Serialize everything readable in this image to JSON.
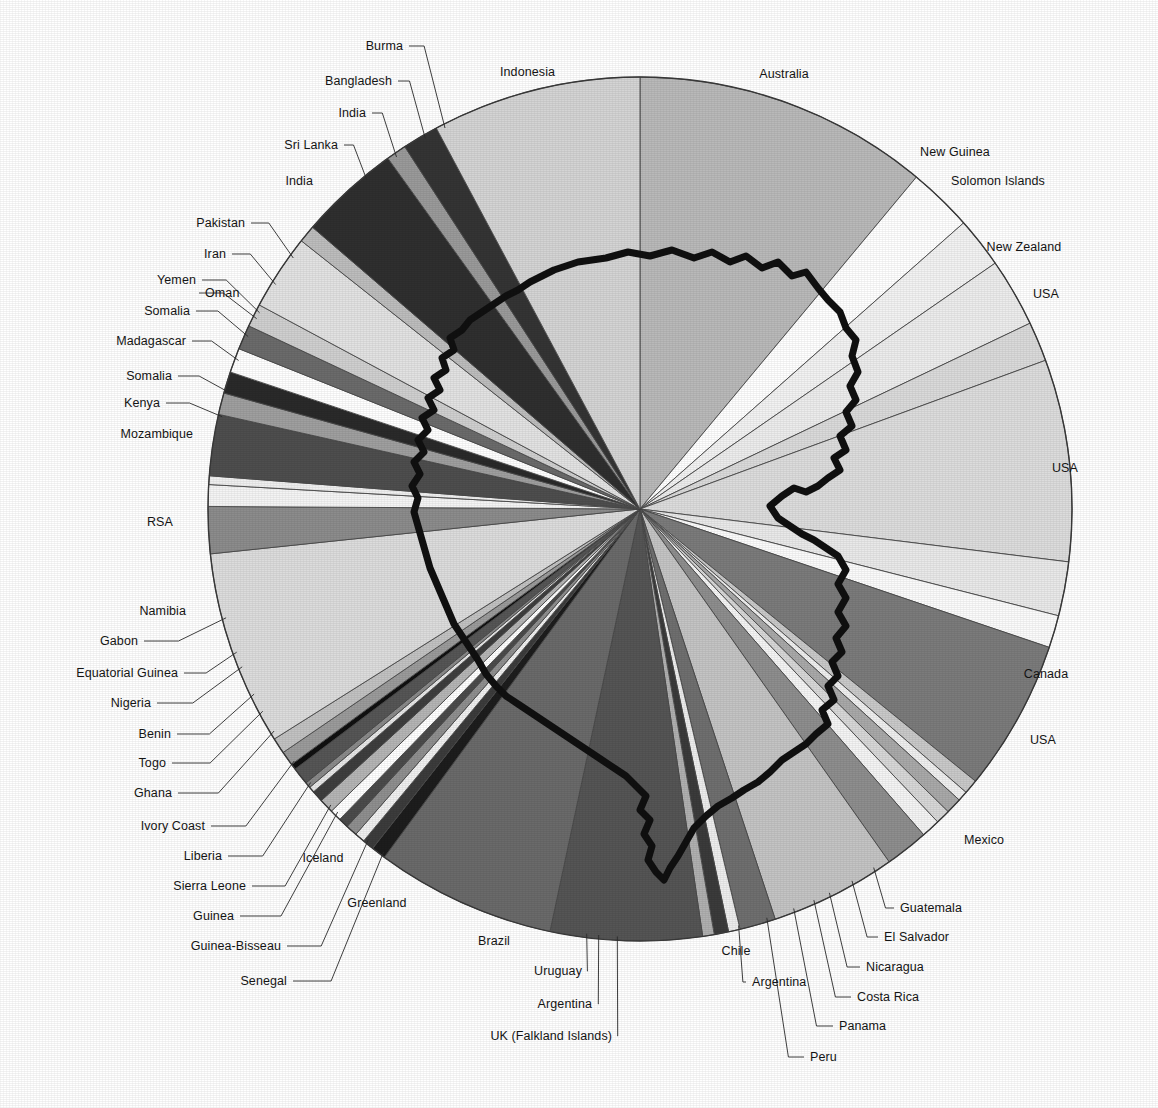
{
  "figure": {
    "type": "pie-wheel-map",
    "center": {
      "x": 640,
      "y": 509
    },
    "radius": 432,
    "background": "#ffffff",
    "outline_color": "#101010",
    "slice_border_color": "#4a4a4a"
  },
  "chart_data": {
    "type": "pie",
    "title": "",
    "subtitle": "",
    "xlabel": "",
    "ylabel": "",
    "legend_position": "leader-lines around perimeter",
    "grid": false,
    "units": "degrees of arc (share of total)",
    "start_angle_deg": -90,
    "direction": "clockwise",
    "categories": [
      "Australia",
      "New Guinea",
      "Solomon Islands",
      "New Zealand",
      "USA",
      "USA",
      "Canada",
      "USA",
      "Mexico",
      "Guatemala",
      "El Salvador",
      "Nicaragua",
      "Costa Rica",
      "Panama",
      "Peru",
      "Chile",
      "Argentina",
      "UK (Falkland Islands)",
      "Argentina",
      "Uruguay",
      "Brazil",
      "Greenland",
      "Iceland",
      "Senegal",
      "Guinea-Bissau",
      "Guinea",
      "Sierra Leone",
      "Liberia",
      "Ivory Coast",
      "Ghana",
      "Togo",
      "Benin",
      "Nigeria",
      "Equatorial Guinea",
      "Gabon",
      "Namibia",
      "RSA",
      "Mozambique",
      "Kenya",
      "Somalia",
      "Madagascar",
      "Somalia",
      "Oman",
      "Yemen",
      "Iran",
      "Pakistan",
      "India",
      "Sri Lanka",
      "India",
      "Bangladesh",
      "Burma",
      "Indonesia"
    ],
    "values": [
      41.0,
      9.0,
      7.0,
      9.5,
      5.5,
      28.0,
      7.5,
      4.5,
      21.0,
      2.0,
      1.4,
      2.2,
      2.0,
      2.6,
      6.0,
      17.5,
      5.0,
      1.6,
      2.0,
      1.6,
      21.0,
      25.0,
      2.0,
      1.6,
      1.4,
      1.6,
      1.4,
      1.6,
      2.0,
      1.6,
      0.8,
      0.8,
      2.4,
      0.8,
      2.0,
      2.2,
      27.0,
      6.5,
      3.0,
      1.2,
      8.5,
      3.0,
      3.0,
      3.4,
      3.4,
      3.2,
      10.5,
      2.4,
      14.0,
      2.8,
      5.0,
      29.0
    ],
    "shades": [
      "#b9b9b9",
      "#ffffff",
      "#f2f2f2",
      "#ececec",
      "#dadada",
      "#dcdcdc",
      "#e9e9e9",
      "#fbfbfb",
      "#7b7b7b",
      "#c9c9c9",
      "#efefef",
      "#a9a9a9",
      "#d7d7d7",
      "#f4f4f4",
      "#8e8e8e",
      "#c4c4c4",
      "#6f6f6f",
      "#ededed",
      "#3b3b3b",
      "#b0b0b0",
      "#555555",
      "#6a6a6a",
      "#1d1d1d",
      "#3c3c3c",
      "#f0f0f0",
      "#8f8f8f",
      "#4b4b4b",
      "#ffffff",
      "#b5b5b5",
      "#3e3e3e",
      "#e7e7e7",
      "#8a8a8a",
      "#565656",
      "#101010",
      "#9b9b9b",
      "#c2c2c2",
      "#dcdcdc",
      "#8c8c8c",
      "#f4f4f4",
      "#efefef",
      "#4e4e4e",
      "#9f9f9f",
      "#2a2a2a",
      "#ffffff",
      "#6b6b6b",
      "#cfcfcf",
      "#e2e2e2",
      "#bdbdbd",
      "#2f2f2f",
      "#9a9a9a",
      "#343434",
      "#d4d4d4"
    ]
  },
  "labels": [
    {
      "id": "burma",
      "text": "Burma",
      "x": 403,
      "y": 46,
      "anchor": "r",
      "leader": true
    },
    {
      "id": "indonesia",
      "text": "Indonesia",
      "x": 500,
      "y": 72,
      "anchor": "l",
      "leader": false
    },
    {
      "id": "australia",
      "text": "Australia",
      "x": 784,
      "y": 74,
      "anchor": "c",
      "leader": false
    },
    {
      "id": "bangladesh",
      "text": "Bangladesh",
      "x": 392,
      "y": 81,
      "anchor": "r",
      "leader": true
    },
    {
      "id": "india-1",
      "text": "India",
      "x": 366,
      "y": 113,
      "anchor": "r",
      "leader": true
    },
    {
      "id": "new-guinea",
      "text": "New Guinea",
      "x": 955,
      "y": 152,
      "anchor": "c",
      "leader": false
    },
    {
      "id": "sri-lanka",
      "text": "Sri Lanka",
      "x": 338,
      "y": 145,
      "anchor": "r",
      "leader": true
    },
    {
      "id": "solomon-islands",
      "text": "Solomon Islands",
      "x": 998,
      "y": 181,
      "anchor": "c",
      "leader": false
    },
    {
      "id": "india-2",
      "text": "India",
      "x": 313,
      "y": 181,
      "anchor": "r",
      "leader": false
    },
    {
      "id": "new-zealand",
      "text": "New Zealand",
      "x": 1024,
      "y": 247,
      "anchor": "c",
      "leader": false
    },
    {
      "id": "pakistan",
      "text": "Pakistan",
      "x": 245,
      "y": 223,
      "anchor": "r",
      "leader": true
    },
    {
      "id": "usa-1",
      "text": "USA",
      "x": 1046,
      "y": 294,
      "anchor": "c",
      "leader": false
    },
    {
      "id": "iran",
      "text": "Iran",
      "x": 226,
      "y": 254,
      "anchor": "r",
      "leader": true
    },
    {
      "id": "yemen",
      "text": "Yemen",
      "x": 196,
      "y": 280,
      "anchor": "r",
      "leader": true
    },
    {
      "id": "oman",
      "text": "Oman",
      "x": 205,
      "y": 293,
      "anchor": "l",
      "leader": true
    },
    {
      "id": "somalia-1",
      "text": "Somalia",
      "x": 190,
      "y": 311,
      "anchor": "r",
      "leader": true
    },
    {
      "id": "madagascar",
      "text": "Madagascar",
      "x": 186,
      "y": 341,
      "anchor": "r",
      "leader": true
    },
    {
      "id": "somalia-2",
      "text": "Somalia",
      "x": 172,
      "y": 376,
      "anchor": "r",
      "leader": true
    },
    {
      "id": "kenya",
      "text": "Kenya",
      "x": 160,
      "y": 403,
      "anchor": "r",
      "leader": true
    },
    {
      "id": "mozambique",
      "text": "Mozambique",
      "x": 193,
      "y": 434,
      "anchor": "r",
      "leader": false
    },
    {
      "id": "usa-2",
      "text": "USA",
      "x": 1065,
      "y": 468,
      "anchor": "c",
      "leader": false
    },
    {
      "id": "rsa",
      "text": "RSA",
      "x": 160,
      "y": 522,
      "anchor": "c",
      "leader": false
    },
    {
      "id": "namibia",
      "text": "Namibia",
      "x": 186,
      "y": 611,
      "anchor": "r",
      "leader": false
    },
    {
      "id": "canada",
      "text": "Canada",
      "x": 1046,
      "y": 674,
      "anchor": "c",
      "leader": false
    },
    {
      "id": "gabon",
      "text": "Gabon",
      "x": 138,
      "y": 641,
      "anchor": "r",
      "leader": true
    },
    {
      "id": "equatorial-guinea",
      "text": "Equatorial Guinea",
      "x": 178,
      "y": 673,
      "anchor": "r",
      "leader": true
    },
    {
      "id": "usa-3",
      "text": "USA",
      "x": 1043,
      "y": 740,
      "anchor": "c",
      "leader": false
    },
    {
      "id": "nigeria",
      "text": "Nigeria",
      "x": 151,
      "y": 703,
      "anchor": "r",
      "leader": true
    },
    {
      "id": "benin",
      "text": "Benin",
      "x": 171,
      "y": 734,
      "anchor": "r",
      "leader": true
    },
    {
      "id": "togo",
      "text": "Togo",
      "x": 166,
      "y": 763,
      "anchor": "r",
      "leader": true
    },
    {
      "id": "ghana",
      "text": "Ghana",
      "x": 172,
      "y": 793,
      "anchor": "r",
      "leader": true
    },
    {
      "id": "ivory-coast",
      "text": "Ivory Coast",
      "x": 205,
      "y": 826,
      "anchor": "r",
      "leader": true
    },
    {
      "id": "mexico",
      "text": "Mexico",
      "x": 984,
      "y": 840,
      "anchor": "c",
      "leader": false
    },
    {
      "id": "liberia",
      "text": "Liberia",
      "x": 222,
      "y": 856,
      "anchor": "r",
      "leader": true
    },
    {
      "id": "iceland",
      "text": "Iceland",
      "x": 323,
      "y": 858,
      "anchor": "c",
      "leader": false
    },
    {
      "id": "sierra-leone",
      "text": "Sierra Leone",
      "x": 246,
      "y": 886,
      "anchor": "r",
      "leader": true
    },
    {
      "id": "greenland",
      "text": "Greenland",
      "x": 377,
      "y": 903,
      "anchor": "c",
      "leader": false
    },
    {
      "id": "guatemala",
      "text": "Guatemala",
      "x": 900,
      "y": 908,
      "anchor": "l",
      "leader": true
    },
    {
      "id": "guinea",
      "text": "Guinea",
      "x": 234,
      "y": 916,
      "anchor": "r",
      "leader": true
    },
    {
      "id": "el-salvador",
      "text": "El Salvador",
      "x": 884,
      "y": 937,
      "anchor": "l",
      "leader": true
    },
    {
      "id": "brazil",
      "text": "Brazil",
      "x": 494,
      "y": 941,
      "anchor": "c",
      "leader": false
    },
    {
      "id": "chile",
      "text": "Chile",
      "x": 736,
      "y": 951,
      "anchor": "c",
      "leader": false
    },
    {
      "id": "guinea-bissau",
      "text": "Guinea-Bisseau",
      "x": 281,
      "y": 946,
      "anchor": "r",
      "leader": true
    },
    {
      "id": "nicaragua",
      "text": "Nicaragua",
      "x": 866,
      "y": 967,
      "anchor": "l",
      "leader": true
    },
    {
      "id": "uruguay",
      "text": "Uruguay",
      "x": 582,
      "y": 971,
      "anchor": "r",
      "leader": true
    },
    {
      "id": "argentina-1",
      "text": "Argentina",
      "x": 752,
      "y": 982,
      "anchor": "l",
      "leader": true
    },
    {
      "id": "senegal",
      "text": "Senegal",
      "x": 287,
      "y": 981,
      "anchor": "r",
      "leader": true
    },
    {
      "id": "costa-rica",
      "text": "Costa Rica",
      "x": 857,
      "y": 997,
      "anchor": "l",
      "leader": true
    },
    {
      "id": "argentina-2",
      "text": "Argentina",
      "x": 592,
      "y": 1004,
      "anchor": "r",
      "leader": true
    },
    {
      "id": "panama",
      "text": "Panama",
      "x": 839,
      "y": 1026,
      "anchor": "l",
      "leader": true
    },
    {
      "id": "uk-falkland",
      "text": "UK (Falkland Islands)",
      "x": 612,
      "y": 1036,
      "anchor": "r",
      "leader": true
    },
    {
      "id": "peru",
      "text": "Peru",
      "x": 810,
      "y": 1057,
      "anchor": "l",
      "leader": true
    }
  ]
}
